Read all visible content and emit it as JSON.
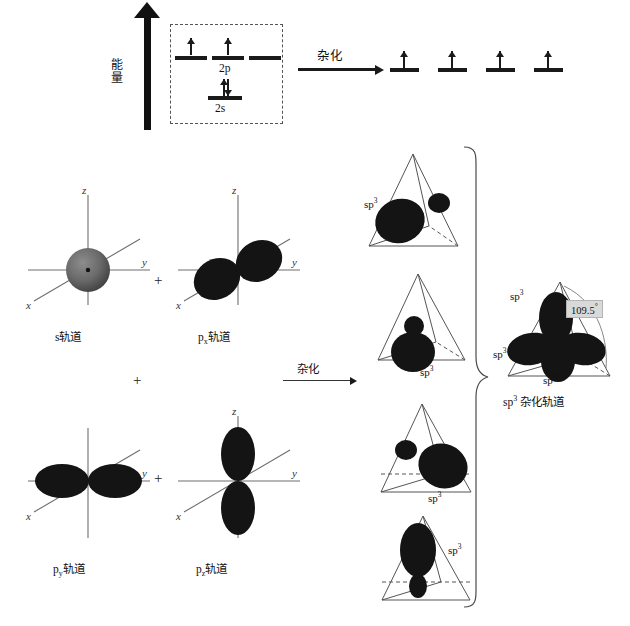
{
  "diagram": {
    "energy_axis_label": "能量",
    "hybridize_label_top": "杂化",
    "hybridize_label_middle": "杂化",
    "ground_state": {
      "p_level_label": "2p",
      "s_level_label": "2s",
      "p_orbitals": [
        {
          "electrons": 1
        },
        {
          "electrons": 1
        },
        {
          "electrons": 0
        }
      ],
      "s_orbitals": [
        {
          "electrons": 2
        }
      ]
    },
    "hybrid_state": {
      "orbitals": [
        {
          "electrons": 1
        },
        {
          "electrons": 1
        },
        {
          "electrons": 1
        },
        {
          "electrons": 1
        }
      ]
    },
    "orbital_plots": [
      {
        "caption_main": "s",
        "caption_sub": "",
        "caption_tail": "轨道",
        "shape": "sphere",
        "axis_labels": [
          "z",
          "y",
          "x"
        ]
      },
      {
        "caption_main": "p",
        "caption_sub": "x",
        "caption_tail": "轨道",
        "shape": "dumbbell-x",
        "axis_labels": [
          "z",
          "y",
          "x"
        ]
      },
      {
        "caption_main": "p",
        "caption_sub": "y",
        "caption_tail": "轨道",
        "shape": "dumbbell-y",
        "axis_labels": [
          "z",
          "y",
          "x"
        ]
      },
      {
        "caption_main": "p",
        "caption_sub": "z",
        "caption_tail": "轨道",
        "shape": "dumbbell-z",
        "axis_labels": [
          "z",
          "y",
          "x"
        ]
      }
    ],
    "plus_signs": [
      "+",
      "+",
      "+"
    ],
    "tetrahedra": [
      {
        "label_main": "sp",
        "label_sup": "3",
        "lobe_direction": "front-left"
      },
      {
        "label_main": "sp",
        "label_sup": "3",
        "lobe_direction": "bottom-front"
      },
      {
        "label_main": "sp",
        "label_sup": "3",
        "lobe_direction": "bottom-right"
      },
      {
        "label_main": "sp",
        "label_sup": "3",
        "lobe_direction": "top"
      }
    ],
    "result": {
      "labels": [
        {
          "main": "sp",
          "sup": "3"
        },
        {
          "main": "sp",
          "sup": "3"
        },
        {
          "main": "sp",
          "sup": "3"
        },
        {
          "main": "sp",
          "sup": "3"
        }
      ],
      "angle_value": "109.5",
      "angle_unit": "°",
      "caption_main": "sp",
      "caption_sup": "3",
      "caption_tail": " 杂化轨道"
    }
  }
}
